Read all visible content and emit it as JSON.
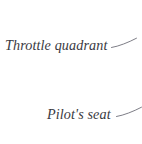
{
  "figure": {
    "type": "technical-illustration-callouts",
    "background_color": "#ffffff",
    "text_color": "#3a3a42",
    "leader_line_color": "#6e6e78",
    "callouts": [
      {
        "id": "throttle-quadrant",
        "label": "Throttle quadrant",
        "leader": {
          "direction": "up-right",
          "length_px": 24
        }
      },
      {
        "id": "pilot-seat",
        "label": "Pilot's seat",
        "leader": {
          "direction": "up-right",
          "length_px": 24
        }
      }
    ]
  }
}
